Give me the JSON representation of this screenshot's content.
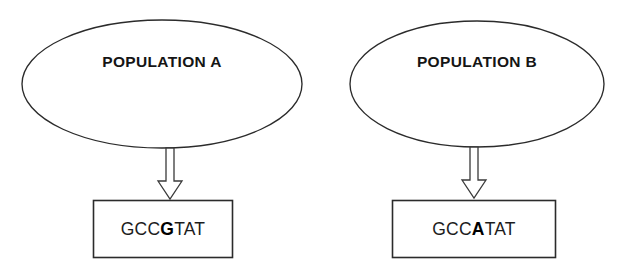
{
  "figure": {
    "background_color": "#ffffff",
    "line_color": "#2b2b2b",
    "text_color": "#151515",
    "groups": [
      {
        "id": "population-a",
        "ellipse_label": "POPULATION A",
        "arrow": "down-block-arrow",
        "sequence": {
          "prefix": "GCC",
          "variant": "G",
          "suffix": "TAT",
          "full": "GCCGTAT"
        }
      },
      {
        "id": "population-b",
        "ellipse_label": "POPULATION B",
        "arrow": "down-block-arrow",
        "sequence": {
          "prefix": "GCC",
          "variant": "A",
          "suffix": "TAT",
          "full": "GCCATAT"
        }
      }
    ]
  }
}
